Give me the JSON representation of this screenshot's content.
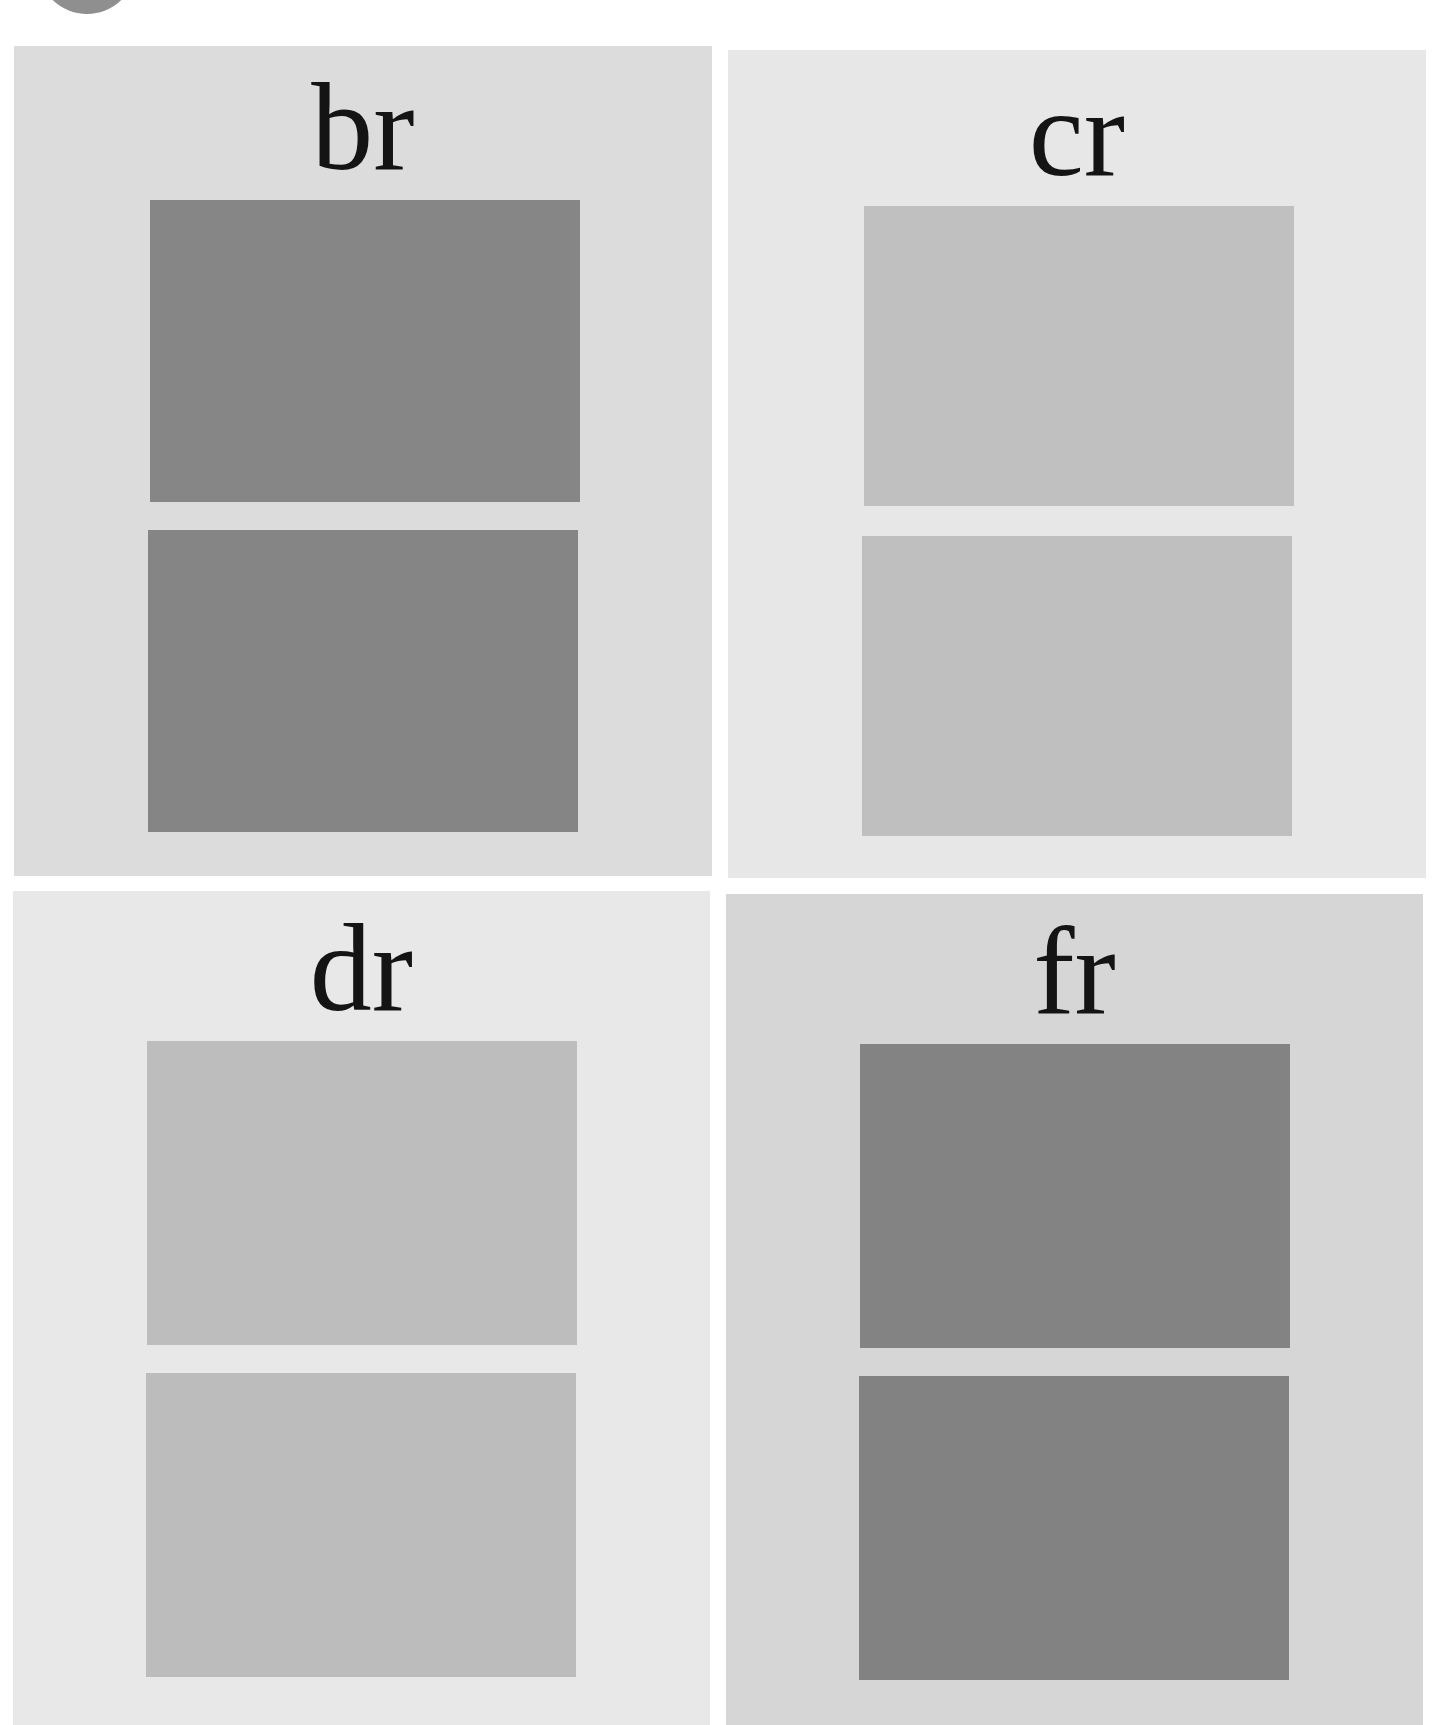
{
  "figure": {
    "badge_color": "#8f8f8f",
    "panels": [
      {
        "id": "br",
        "label": "br",
        "background": "#dcdcdc",
        "box": {
          "left": 14,
          "top": 46,
          "width": 698,
          "height": 830
        },
        "label_top": 60,
        "swatches": [
          {
            "left": 136,
            "top": 154,
            "width": 430,
            "height": 302,
            "color": "#868686"
          },
          {
            "left": 134,
            "top": 484,
            "width": 430,
            "height": 302,
            "color": "#858585"
          }
        ]
      },
      {
        "id": "cr",
        "label": "cr",
        "background": "#e7e7e7",
        "box": {
          "left": 728,
          "top": 50,
          "width": 698,
          "height": 828
        },
        "label_top": 62,
        "swatches": [
          {
            "left": 136,
            "top": 156,
            "width": 430,
            "height": 300,
            "color": "#c0c0c0"
          },
          {
            "left": 134,
            "top": 486,
            "width": 430,
            "height": 300,
            "color": "#bfbfbf"
          }
        ]
      },
      {
        "id": "dr",
        "label": "dr",
        "background": "#e8e8e8",
        "box": {
          "left": 13,
          "top": 891,
          "width": 697,
          "height": 834
        },
        "label_top": 56,
        "swatches": [
          {
            "left": 134,
            "top": 150,
            "width": 430,
            "height": 304,
            "color": "#bdbdbd"
          },
          {
            "left": 133,
            "top": 482,
            "width": 430,
            "height": 304,
            "color": "#bcbcbc"
          }
        ]
      },
      {
        "id": "fr",
        "label": "fr",
        "background": "#d6d6d6",
        "box": {
          "left": 726,
          "top": 894,
          "width": 697,
          "height": 831
        },
        "label_top": 56,
        "swatches": [
          {
            "left": 134,
            "top": 150,
            "width": 430,
            "height": 304,
            "color": "#838383"
          },
          {
            "left": 133,
            "top": 482,
            "width": 430,
            "height": 304,
            "color": "#828282"
          }
        ]
      }
    ]
  }
}
